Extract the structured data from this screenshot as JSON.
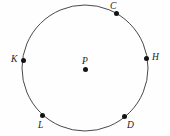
{
  "figure": {
    "name": "circle-with-labeled-points",
    "type": "geometry-diagram",
    "width": 170,
    "height": 136,
    "background_color": "#fefefe",
    "stroke_color": "#4a4a4a",
    "point_color": "#141414",
    "label_color": "#1a1a1a"
  },
  "circle": {
    "center_x": 85,
    "center_y": 68,
    "radius": 63,
    "stroke_width": 1
  },
  "center_point": {
    "label": "P",
    "x": 85,
    "y": 69,
    "label_x": 82,
    "label_y": 56
  },
  "points": [
    {
      "label": "C",
      "x": 116,
      "y": 13,
      "label_x": 110,
      "label_y": 1,
      "angle_deg": 60.6
    },
    {
      "label": "H",
      "x": 146,
      "y": 58,
      "label_x": 152,
      "label_y": 52,
      "angle_deg": 9.3
    },
    {
      "label": "K",
      "x": 23,
      "y": 60,
      "label_x": 11,
      "label_y": 54,
      "angle_deg": 172.6
    },
    {
      "label": "L",
      "x": 42,
      "y": 115,
      "label_x": 38,
      "label_y": 120,
      "angle_deg": 227.5
    },
    {
      "label": "D",
      "x": 124,
      "y": 116,
      "label_x": 127,
      "label_y": 120,
      "angle_deg": 309.1
    }
  ]
}
